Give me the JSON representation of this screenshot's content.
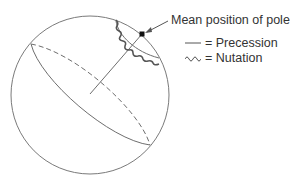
{
  "diagram": {
    "annotation": "Mean position of pole",
    "legend": [
      {
        "symbol": "straight-line",
        "label": "= Precession"
      },
      {
        "symbol": "wavy-line",
        "label": "= Nutation"
      }
    ],
    "colors": {
      "line": "#6e6e6e",
      "nutation": "#555555",
      "pole": "#111111",
      "text": "#333333"
    }
  }
}
